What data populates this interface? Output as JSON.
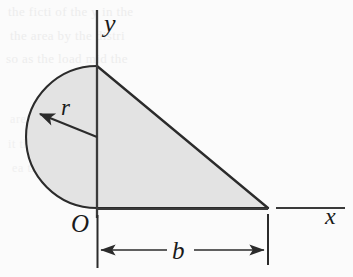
{
  "figure": {
    "type": "geometry-diagram",
    "canvas": {
      "width": 353,
      "height": 277
    },
    "colors": {
      "background": "#fbfbfb",
      "region_fill": "#e3e3e3",
      "stroke": "#2b2b2b",
      "label": "#1a1a1a",
      "bleed_through": "#ededed"
    },
    "axes": {
      "y_axis": {
        "label": "y",
        "x": 97,
        "y_top": 10,
        "y_bottom": 218
      },
      "x_axis": {
        "label": "x",
        "y": 209,
        "x_left": 97,
        "x_right": 345
      },
      "origin": {
        "label": "O",
        "x": 97,
        "y": 209
      }
    },
    "shape": {
      "semicircle": {
        "center": {
          "x": 97,
          "y": 137
        },
        "radius": 71,
        "side": "left",
        "radius_label": "r",
        "radius_arrow": {
          "from_x": 97,
          "from_y": 137,
          "to_x": 37,
          "to_y": 113
        }
      },
      "triangle": {
        "apex": {
          "x": 97,
          "y": 66
        },
        "right_vertex": {
          "x": 268,
          "y": 208
        },
        "origin_vertex": {
          "x": 97,
          "y": 208
        }
      }
    },
    "dimension": {
      "label": "b",
      "line_y": 250,
      "x_start": 97,
      "x_end": 268,
      "extension_top": 215,
      "extension_bottom": 268,
      "arrows": "double"
    },
    "labels": {
      "y_axis_label": "y",
      "x_axis_label": "x",
      "origin_label": "O",
      "radius_label": "r",
      "base_label": "b"
    },
    "bleed_through_lines": [
      "the ficti    of the   y in the",
      "the   area  by  the     distri",
      "so  as  the  load   mid  the",
      "area shown   with   distan",
      "it   the     the      get    a  n",
      "ea    the    area    the    mo"
    ]
  }
}
